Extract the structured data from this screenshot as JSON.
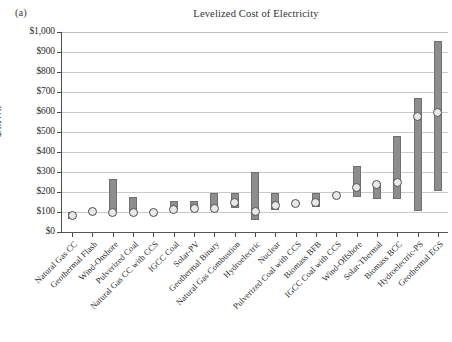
{
  "figure": {
    "panel_label": "(a)",
    "title": "Levelized Cost of Electricity"
  },
  "axes": {
    "y_title": "$/MWh",
    "y_ticks": [
      "$0",
      "$100",
      "$200",
      "$300",
      "$400",
      "$500",
      "$600",
      "$700",
      "$800",
      "$900",
      "$1,000"
    ]
  },
  "colors": {
    "bar_fill": "#8d8d8d",
    "bar_stroke": "#6f6f6f",
    "marker_fill": "#e8e8e8",
    "marker_stroke": "#4f4f4f",
    "gridline": "#c9c9c9",
    "axis": "#4a4a4a",
    "text": "#2b2b2b"
  },
  "chart_data": {
    "type": "bar",
    "title": "Levelized Cost of Electricity",
    "subtitle": "(a)",
    "xlabel": "",
    "ylabel": "$/MWh",
    "ylim": [
      0,
      1000
    ],
    "ytick_step": 100,
    "grid": true,
    "legend": "none",
    "note": "Floating range bars (low-to-high levelized cost) with a circular marker at the representative/central value.",
    "categories": [
      "Natural Gas CC",
      "Geothermal Flash",
      "Wind-Onshore",
      "Pulverized Coal",
      "Natural Gas CC with CCS",
      "IGCC Coal",
      "Solar-PV",
      "Geothermal Binary",
      "Natural Gas Combustion",
      "Hydroelectric",
      "Nuclear",
      "Pulverized Coal with CCS",
      "Biomass BFB",
      "IGCC Coal with CCS",
      "Wind-Offshore",
      "Solar-Thermal",
      "Biomass BCC",
      "Hydroelectric-PS",
      "Geothermal EGS"
    ],
    "series": [
      {
        "name": "Low",
        "values": [
          65,
          100,
          100,
          100,
          95,
          110,
          110,
          110,
          120,
          60,
          110,
          140,
          125,
          180,
          175,
          165,
          165,
          105,
          205
        ]
      },
      {
        "name": "High",
        "values": [
          100,
          112,
          265,
          175,
          105,
          155,
          155,
          195,
          195,
          300,
          195,
          152,
          195,
          192,
          330,
          245,
          480,
          670,
          955
        ]
      },
      {
        "name": "Marker",
        "values": [
          85,
          105,
          100,
          100,
          100,
          115,
          118,
          120,
          150,
          105,
          135,
          145,
          150,
          185,
          225,
          240,
          250,
          580,
          600
        ]
      }
    ]
  }
}
